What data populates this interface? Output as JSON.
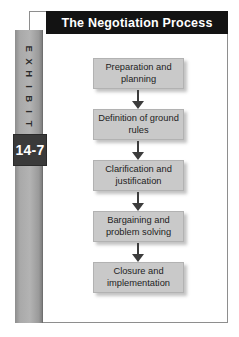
{
  "exhibit": {
    "tab_label": "EXHIBIT",
    "tab_letters": [
      "E",
      "X",
      "H",
      "I",
      "B",
      "I",
      "T"
    ],
    "number": "14-7"
  },
  "header": {
    "title": "The Negotiation Process"
  },
  "diagram": {
    "type": "flowchart",
    "orientation": "vertical",
    "connector": "downward-arrow",
    "steps": [
      {
        "label": "Preparation and planning"
      },
      {
        "label": "Definition of ground rules"
      },
      {
        "label": "Clarification and justification"
      },
      {
        "label": "Bargaining and problem solving"
      },
      {
        "label": "Closure and implementation"
      }
    ]
  },
  "colors": {
    "banner_background": "#131313",
    "banner_text": "#ffffff",
    "tab_background": "#b3b3b3",
    "number_plate": "#3a3a3a",
    "box_fill": "#c9c9c9",
    "box_text": "#1d1d1d",
    "arrow": "#3c3c3c",
    "panel_background": "#ffffff",
    "panel_border": "#8e8e8e"
  }
}
